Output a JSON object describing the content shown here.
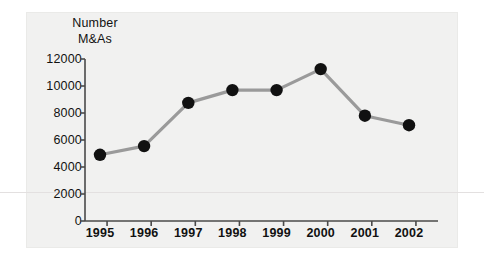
{
  "figure": {
    "title_line1": "Number",
    "title_line2": "M&As",
    "panel_color": "#f1f1f0",
    "page_color": "#ffffff",
    "line_color": "#9a9a9a",
    "marker_color": "#111111",
    "axis_color": "#4a4a4a"
  },
  "chart_data": {
    "type": "line",
    "title": "Number M&As",
    "xlabel": "",
    "ylabel": "Number M&As",
    "categories": [
      "1995",
      "1996",
      "1997",
      "1998",
      "1999",
      "2000",
      "2001",
      "2002"
    ],
    "values": [
      4900,
      5550,
      8750,
      9700,
      9700,
      11250,
      7800,
      7100
    ],
    "series": [
      {
        "name": "Number M&As",
        "values": [
          4900,
          5550,
          8750,
          9700,
          9700,
          11250,
          7800,
          7100
        ]
      }
    ],
    "ylim": [
      0,
      12000
    ],
    "yticks": [
      0,
      2000,
      4000,
      6000,
      8000,
      10000,
      12000
    ],
    "ytick_labels": [
      "0",
      "2000",
      "4000",
      "6000",
      "8000",
      "10000",
      "12000"
    ],
    "xtick_labels": [
      "1995",
      "1996",
      "1997",
      "1998",
      "1999",
      "2000",
      "2001",
      "2002"
    ],
    "grid": false,
    "legend": false,
    "marker": "circle",
    "marker_color": "#111111",
    "line_color": "#9a9a9a"
  }
}
